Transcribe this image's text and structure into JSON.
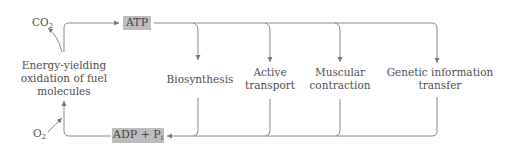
{
  "diagram": {
    "nodes": {
      "co2": {
        "text": "CO",
        "sub": "2"
      },
      "o2": {
        "text": "O",
        "sub": "2"
      },
      "oxidation": {
        "line1": "Energy-yielding",
        "line2": "oxidation of fuel",
        "line3": "molecules"
      },
      "atp": {
        "label": "ATP"
      },
      "adp": {
        "text": "ADP + P",
        "sub": "i"
      },
      "biosynthesis": {
        "line1": "Biosynthesis"
      },
      "active_transport": {
        "line1": "Active",
        "line2": "transport"
      },
      "muscular_contraction": {
        "line1": "Muscular",
        "line2": "contraction"
      },
      "genetic_transfer": {
        "line1": "Genetic information",
        "line2": "transfer"
      }
    },
    "edges": [
      {
        "from": "oxidation",
        "to": "atp"
      },
      {
        "from": "oxidation",
        "to": "co2"
      },
      {
        "from": "o2",
        "to": "oxidation"
      },
      {
        "from": "adp",
        "to": "oxidation"
      },
      {
        "from": "atp",
        "to": "biosynthesis"
      },
      {
        "from": "atp",
        "to": "active_transport"
      },
      {
        "from": "atp",
        "to": "muscular_contraction"
      },
      {
        "from": "atp",
        "to": "genetic_transfer"
      },
      {
        "from": "biosynthesis",
        "to": "adp"
      },
      {
        "from": "active_transport",
        "to": "adp"
      },
      {
        "from": "muscular_contraction",
        "to": "adp"
      },
      {
        "from": "genetic_transfer",
        "to": "adp"
      }
    ],
    "colors": {
      "box_fill": "#bdbdbd",
      "line": "#7a7a7a",
      "text": "#505050"
    }
  }
}
